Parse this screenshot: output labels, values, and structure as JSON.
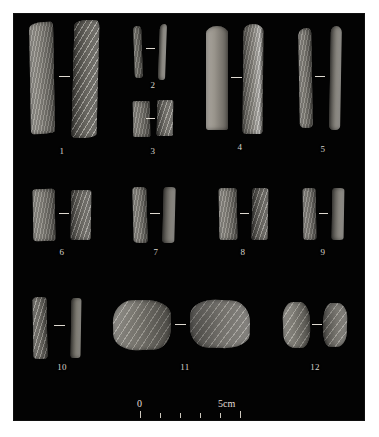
{
  "figure": {
    "background_color": "#ffffff",
    "plate_color": "#030303",
    "label_color": "#d8d4cb",
    "artifact_color": "#8e8b80",
    "plate": {
      "x": 14,
      "y": 14,
      "width": 350,
      "height": 406
    }
  },
  "specimens": [
    {
      "number": "1",
      "label_x": 62,
      "label_y": 146,
      "views": [
        {
          "x": 30,
          "y": 22,
          "width": 24,
          "height": 112,
          "tone": "#95928a",
          "texture": "tex-fine",
          "shape": "62% 10% 58% 12% / 6% 5% 3% 4%",
          "rotate": -1,
          "highlight": "left"
        },
        {
          "x": 73,
          "y": 20,
          "width": 25,
          "height": 118,
          "tone": "#8d8a81",
          "texture": "tex-ridge-steep",
          "shape": "58% 14% 54% 14% / 5% 6% 4% 3%",
          "rotate": 1.5,
          "highlight": "right"
        }
      ]
    },
    {
      "number": "2",
      "label_x": 153,
      "label_y": 80,
      "views": [
        {
          "x": 134,
          "y": 26,
          "width": 8,
          "height": 52,
          "tone": "#7c7a72",
          "texture": "tex-fine",
          "shape": "50% 50% 40% 40% / 8% 8% 6% 6%",
          "rotate": -2,
          "highlight": "left"
        },
        {
          "x": 159,
          "y": 24,
          "width": 7,
          "height": 56,
          "tone": "#8b8880",
          "texture": "tex-plain",
          "shape": "60% 40% 30% 50% / 10% 6% 5% 8%",
          "rotate": 2,
          "highlight": "right"
        }
      ]
    },
    {
      "number": "3",
      "label_x": 153,
      "label_y": 146,
      "views": [
        {
          "x": 133,
          "y": 101,
          "width": 17,
          "height": 36,
          "tone": "#86837b",
          "texture": "tex-fine",
          "shape": "14% 12% 12% 14% / 4% 4% 4% 4%",
          "rotate": -1,
          "highlight": "left"
        },
        {
          "x": 157,
          "y": 100,
          "width": 16,
          "height": 36,
          "tone": "#8f8c84",
          "texture": "tex-ridge",
          "shape": "12% 14% 14% 12% / 4% 4% 4% 4%",
          "rotate": 1,
          "highlight": "right"
        }
      ]
    },
    {
      "number": "4",
      "label_x": 240,
      "label_y": 142,
      "views": [
        {
          "x": 206,
          "y": 26,
          "width": 22,
          "height": 104,
          "tone": "#948f86",
          "texture": "tex-plain",
          "shape": "70% 70% 16% 16% / 10% 10% 4% 4%",
          "rotate": 0,
          "highlight": "left"
        },
        {
          "x": 243,
          "y": 24,
          "width": 20,
          "height": 110,
          "tone": "#8a877f",
          "texture": "tex-fine",
          "shape": "68% 66% 20% 18% / 9% 9% 5% 5%",
          "rotate": 0.5,
          "highlight": "edge"
        }
      ]
    },
    {
      "number": "5",
      "label_x": 323,
      "label_y": 144,
      "views": [
        {
          "x": 299,
          "y": 28,
          "width": 13,
          "height": 100,
          "tone": "#8b8880",
          "texture": "tex-fine",
          "shape": "70% 30% 40% 40% / 7% 5% 4% 4%",
          "rotate": -1,
          "highlight": "left"
        },
        {
          "x": 330,
          "y": 26,
          "width": 11,
          "height": 104,
          "tone": "#7e7b74",
          "texture": "tex-plain",
          "shape": "50% 50% 40% 40% / 6% 6% 4% 4%",
          "rotate": 1,
          "highlight": "right"
        }
      ]
    },
    {
      "number": "6",
      "label_x": 62,
      "label_y": 247,
      "views": [
        {
          "x": 33,
          "y": 189,
          "width": 22,
          "height": 52,
          "tone": "#8e8b83",
          "texture": "tex-fine",
          "shape": "16% 14% 14% 16% / 5% 5% 5% 5%",
          "rotate": -1,
          "highlight": "left"
        },
        {
          "x": 71,
          "y": 190,
          "width": 20,
          "height": 50,
          "tone": "#86837b",
          "texture": "tex-ridge",
          "shape": "14% 16% 16% 14% / 5% 5% 5% 5%",
          "rotate": 1,
          "highlight": "right"
        }
      ]
    },
    {
      "number": "7",
      "label_x": 156,
      "label_y": 247,
      "views": [
        {
          "x": 133,
          "y": 187,
          "width": 14,
          "height": 56,
          "tone": "#8b8880",
          "texture": "tex-fine",
          "shape": "30% 40% 30% 40% / 6% 5% 5% 5%",
          "rotate": -1.5,
          "highlight": "left"
        },
        {
          "x": 163,
          "y": 187,
          "width": 12,
          "height": 56,
          "tone": "#76736c",
          "texture": "tex-plain",
          "shape": "36% 36% 30% 30% / 6% 5% 5% 5%",
          "rotate": 1.5,
          "highlight": "right"
        }
      ]
    },
    {
      "number": "8",
      "label_x": 243,
      "label_y": 247,
      "views": [
        {
          "x": 219,
          "y": 188,
          "width": 18,
          "height": 52,
          "tone": "#8d8a82",
          "texture": "tex-fine",
          "shape": "22% 20% 18% 20% / 6% 5% 5% 5%",
          "rotate": -1,
          "highlight": "left"
        },
        {
          "x": 252,
          "y": 188,
          "width": 16,
          "height": 52,
          "tone": "#7f7c75",
          "texture": "tex-ridge",
          "shape": "20% 22% 20% 18% / 6% 5% 5% 5%",
          "rotate": 1,
          "highlight": "right"
        }
      ]
    },
    {
      "number": "9",
      "label_x": 323,
      "label_y": 247,
      "views": [
        {
          "x": 303,
          "y": 188,
          "width": 13,
          "height": 52,
          "tone": "#8a8780",
          "texture": "tex-fine",
          "shape": "34% 30% 30% 34% / 6% 5% 5% 5%",
          "rotate": -1,
          "highlight": "left"
        },
        {
          "x": 332,
          "y": 188,
          "width": 12,
          "height": 52,
          "tone": "#7c7972",
          "texture": "tex-plain",
          "shape": "30% 34% 34% 30% / 6% 5% 5% 5%",
          "rotate": 1,
          "highlight": "right"
        }
      ]
    },
    {
      "number": "10",
      "label_x": 62,
      "label_y": 362,
      "views": [
        {
          "x": 33,
          "y": 297,
          "width": 14,
          "height": 62,
          "tone": "#8d8a82",
          "texture": "tex-ridge",
          "shape": "34% 30% 30% 34% / 6% 5% 5% 5%",
          "rotate": -1,
          "highlight": "left"
        },
        {
          "x": 71,
          "y": 298,
          "width": 10,
          "height": 60,
          "tone": "#757269",
          "texture": "tex-plain",
          "shape": "34% 34% 30% 30% / 6% 5% 5% 5%",
          "rotate": 1,
          "highlight": "right"
        }
      ]
    },
    {
      "number": "11",
      "label_x": 185,
      "label_y": 362,
      "views": [
        {
          "x": 113,
          "y": 300,
          "width": 58,
          "height": 50,
          "tone": "#8f8c83",
          "texture": "tex-flake",
          "shape": "34% 46% 30% 40% / 44% 30% 46% 32%",
          "rotate": -2,
          "highlight": "left"
        },
        {
          "x": 190,
          "y": 300,
          "width": 60,
          "height": 48,
          "tone": "#8a8780",
          "texture": "tex-flake",
          "shape": "42% 32% 44% 30% / 32% 46% 30% 44%",
          "rotate": 2,
          "highlight": "right"
        }
      ]
    },
    {
      "number": "12",
      "label_x": 315,
      "label_y": 362,
      "views": [
        {
          "x": 283,
          "y": 302,
          "width": 27,
          "height": 46,
          "tone": "#97948b",
          "texture": "tex-flake",
          "shape": "40% 36% 34% 44% / 36% 40% 42% 30%",
          "rotate": -2,
          "highlight": "left"
        },
        {
          "x": 323,
          "y": 303,
          "width": 24,
          "height": 44,
          "tone": "#8b8880",
          "texture": "tex-flake",
          "shape": "34% 42% 44% 32% / 40% 34% 32% 44%",
          "rotate": 2,
          "highlight": "right"
        }
      ]
    }
  ],
  "pair_dashes": [
    {
      "x": 59,
      "y": 76,
      "width": 11
    },
    {
      "x": 146,
      "y": 48,
      "width": 9
    },
    {
      "x": 146,
      "y": 118,
      "width": 9
    },
    {
      "x": 231,
      "y": 77,
      "width": 11
    },
    {
      "x": 315,
      "y": 76,
      "width": 10
    },
    {
      "x": 59,
      "y": 213,
      "width": 10
    },
    {
      "x": 150,
      "y": 213,
      "width": 10
    },
    {
      "x": 240,
      "y": 213,
      "width": 9
    },
    {
      "x": 319,
      "y": 213,
      "width": 9
    },
    {
      "x": 54,
      "y": 325,
      "width": 11
    },
    {
      "x": 175,
      "y": 324,
      "width": 11
    },
    {
      "x": 312,
      "y": 324,
      "width": 10
    }
  ],
  "scalebar": {
    "x": 140,
    "y": 396,
    "width": 100,
    "start_label": "0",
    "end_label": "5cm",
    "units": "cm",
    "divisions": 5,
    "tick_count": 6
  }
}
